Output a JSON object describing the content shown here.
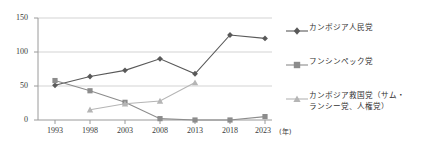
{
  "chart_data": {
    "type": "line",
    "title": "",
    "xlabel": "(年)",
    "ylabel": "",
    "categories": [
      "1993",
      "1998",
      "2003",
      "2008",
      "2013",
      "2018",
      "2023"
    ],
    "x": [
      1993,
      1998,
      2003,
      2008,
      2013,
      2018,
      2023
    ],
    "ylim": [
      0,
      150
    ],
    "yticks": [
      0,
      50,
      100,
      150
    ],
    "ytick_labels": [
      "0",
      "50",
      "100",
      "150"
    ],
    "grid": true,
    "legend_position": "right",
    "series": [
      {
        "name": "カンボジア人民党",
        "marker": "diamond",
        "color": "#595959",
        "values": [
          51,
          64,
          73,
          90,
          68,
          125,
          120
        ]
      },
      {
        "name": "フンシンペック党",
        "marker": "square",
        "color": "#8c8c8c",
        "values": [
          58,
          43,
          26,
          2,
          0,
          0,
          5
        ]
      },
      {
        "name": "カンボジア救国党（サム・\nランシー党、人権党）",
        "marker": "triangle",
        "color": "#b5b5b5",
        "values": [
          null,
          15,
          24,
          28,
          55,
          null,
          null
        ]
      }
    ]
  },
  "axis": {
    "y_tick_0": "0",
    "y_tick_50": "50",
    "y_tick_100": "100",
    "y_tick_150": "150",
    "x_tick_1993": "1993",
    "x_tick_1998": "1998",
    "x_tick_2003": "2003",
    "x_tick_2008": "2008",
    "x_tick_2013": "2013",
    "x_tick_2018": "2018",
    "x_tick_2023": "2023",
    "x_unit": "(年)"
  },
  "legend": {
    "items": [
      {
        "label": "カンボジア人民党",
        "marker": "diamond-marker-icon",
        "color": "#595959"
      },
      {
        "label": "フンシンペック党",
        "marker": "square-marker-icon",
        "color": "#8c8c8c"
      },
      {
        "label": "カンボジア救国党（サム・\nランシー党、人権党）",
        "marker": "triangle-marker-icon",
        "color": "#b5b5b5"
      }
    ]
  }
}
